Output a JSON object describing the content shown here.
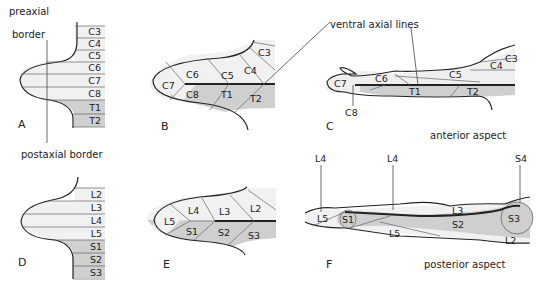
{
  "colors": {
    "light": "#f1f1f1",
    "mid": "#e4e4e4",
    "dark": "#c9c9c9",
    "line": "#222222"
  },
  "annotations": {
    "preaxial_line1": "preaxial",
    "preaxial_line2": "border",
    "postaxial": "postaxial border",
    "ventral_axial": "ventral axial lines",
    "anterior": "anterior aspect",
    "posterior": "posterior aspect"
  },
  "panels": {
    "A": {
      "label": "A",
      "segments": [
        "C3",
        "C4",
        "C5",
        "C6",
        "C7",
        "C8",
        "T1",
        "T2"
      ]
    },
    "B": {
      "label": "B",
      "segments": [
        "C3",
        "C4",
        "C5",
        "C6",
        "C7",
        "C8",
        "T1",
        "T2"
      ]
    },
    "C": {
      "label": "C",
      "segments": [
        "C3",
        "C4",
        "C5",
        "C6",
        "C7",
        "C8",
        "T1",
        "T2"
      ]
    },
    "D": {
      "label": "D",
      "segments": [
        "L2",
        "L3",
        "L4",
        "L5",
        "S1",
        "S2",
        "S3"
      ]
    },
    "E": {
      "label": "E",
      "segments": [
        "L2",
        "L3",
        "L4",
        "L5",
        "S1",
        "S2",
        "S3"
      ]
    },
    "F": {
      "label": "F",
      "segments": [
        "L4",
        "L4",
        "L5",
        "S1",
        "L3",
        "S2",
        "S3",
        "S4",
        "L5",
        "L2"
      ]
    }
  }
}
